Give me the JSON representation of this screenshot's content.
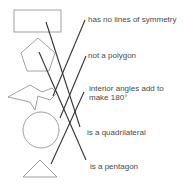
{
  "labels": {
    "l1": "has no lines of symmetry",
    "l2": "not a polygon",
    "l3a": "interior angles add to",
    "l3b": "make 180°",
    "l4": "is a quadrilateral",
    "l5": "is a pentagon"
  },
  "shapes": [
    "rectangle",
    "pentagon",
    "irregular-zigzag-shape",
    "circle",
    "triangle"
  ],
  "colors": {
    "shape_stroke": "#8a8a8a",
    "line_stroke": "#333333",
    "text": "#4a4a4a"
  }
}
